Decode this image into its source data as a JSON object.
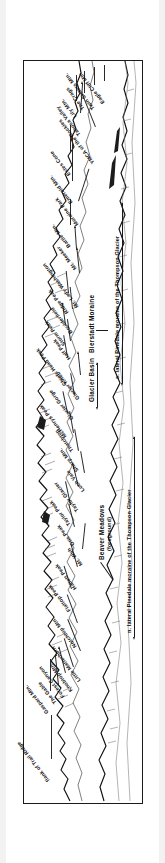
{
  "figure": {
    "type": "annotated-panorama-diagram",
    "orientation": "rotated 90 degrees; printed text appears upside-down in the scan",
    "frame_color": "#1a1a1a",
    "background_color": "#ffffff"
  },
  "peak_labels": [
    {
      "id": "flank-of-trail-ridge",
      "text": "flank of Trail Ridge"
    },
    {
      "id": "gaspard-mtn",
      "text": "Gaspard Mtn."
    },
    {
      "id": "the-gable",
      "text": "The Gable"
    },
    {
      "id": "forest-canyon",
      "text": "Forest Canyon"
    },
    {
      "id": "knobtop-mtn",
      "text": "Knobtop Mtn."
    },
    {
      "id": "little-matterhorn",
      "text": "Little Matterhorn"
    },
    {
      "id": "notchtop-mtn",
      "text": "Notchtop Mtn."
    },
    {
      "id": "flattop-peak",
      "text": "Flattop Peak"
    },
    {
      "id": "hallett-peak",
      "text": "Hallett Peak"
    },
    {
      "id": "mt-wuh",
      "text": "Mt. Wuh"
    },
    {
      "id": "otis-peak",
      "text": "Otis Peak"
    },
    {
      "id": "taylor-peak",
      "text": "Taylor Peak"
    },
    {
      "id": "taylor-glacier",
      "text": "Taylor Glacier"
    },
    {
      "id": "loch-vale",
      "text": "Loch Vale"
    },
    {
      "id": "sharp-mtn",
      "text": "Sharp Mtn."
    },
    {
      "id": "thatchtop",
      "text": "Thatchtop"
    },
    {
      "id": "mchenrys-peak",
      "text": "McHenrys Peak"
    },
    {
      "id": "glacier-gorge",
      "text": "Glacier Gorge"
    },
    {
      "id": "glacier-knob",
      "text": "Glacier Knob"
    },
    {
      "id": "chiefs-head-peak",
      "text": "Chiefs Head Peak"
    },
    {
      "id": "half-peak",
      "text": "Half Peak"
    },
    {
      "id": "storm-peak",
      "text": "Storm Peak"
    },
    {
      "id": "boulderfield",
      "text": "Boulderfield"
    },
    {
      "id": "ridge-peak",
      "text": "Ridge Peak"
    },
    {
      "id": "mt-lady-washington",
      "text": "Mt. Lady Washington"
    },
    {
      "id": "mt-meeker",
      "text": "Mt. Meeker"
    },
    {
      "id": "battle-mtn",
      "text": "Battle Mtn."
    },
    {
      "id": "moraine-park",
      "text": "Moraine Park"
    },
    {
      "id": "emerald-mtn",
      "text": "Emerald Mtn."
    },
    {
      "id": "estes-cone",
      "text": "Estes Cone"
    },
    {
      "id": "ymca-of-the-rockies",
      "text": "YMCA of the Rockies"
    },
    {
      "id": "tahosa-valley",
      "text": "Tahosa Valley"
    },
    {
      "id": "lily-mtn",
      "text": "Lily Mtn."
    },
    {
      "id": "the-crags",
      "text": "The Crags"
    },
    {
      "id": "twin-sisters-mtn",
      "text": "Twin Sisters Mtn."
    },
    {
      "id": "eagle-cliff-mtn",
      "text": "Eagle Cliff Mtn."
    }
  ],
  "captions": {
    "beaver_meadows": "Beaver Meadows",
    "beaver_meadows_note": "(foreground)",
    "glacier_basin": "Glacier Basin",
    "bierstadt_moraine": "Bierstadt Moraine",
    "south_lateral_moraine": "s. lateral Pinedale moraine of the Thompson Glacier",
    "north_lateral_moraine": "n. lateral Pinedale moraine of the Thompson Glacier"
  }
}
